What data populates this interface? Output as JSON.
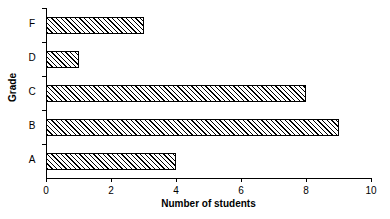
{
  "chart_data": {
    "type": "bar",
    "orientation": "horizontal",
    "title": "",
    "xlabel": "Number of students",
    "ylabel": "Grade",
    "categories": [
      "A",
      "B",
      "C",
      "D",
      "F"
    ],
    "values": [
      4,
      9,
      8,
      1,
      3
    ],
    "xlim": [
      0,
      10
    ],
    "xticks": [
      0,
      2,
      4,
      6,
      8,
      10
    ],
    "xtick_labels": [
      "0",
      "2",
      "4",
      "6",
      "8",
      "10"
    ],
    "grid": false,
    "legend": false,
    "bar_style": {
      "fill": "diagonal-hatch",
      "edge_color": "#000000",
      "face_color": "#ffffff"
    },
    "background": "#ffffff"
  },
  "axes": {
    "x_title": "Number of students",
    "y_title": "Grade"
  }
}
